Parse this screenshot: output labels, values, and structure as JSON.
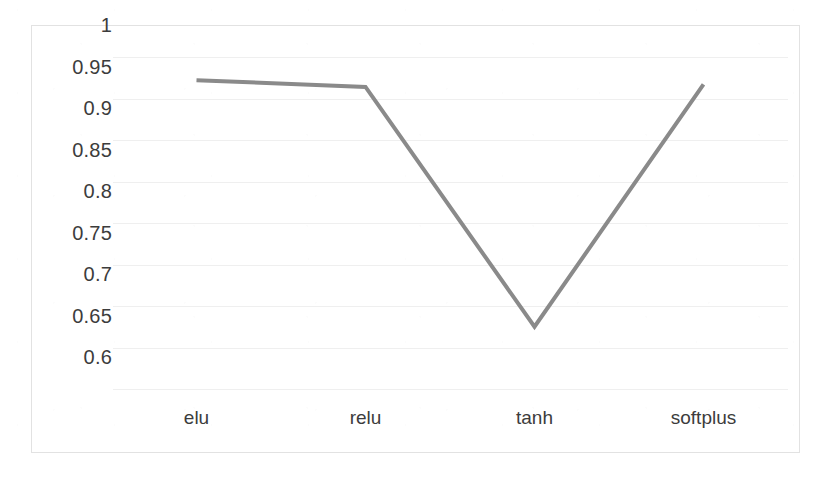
{
  "chart_data": {
    "type": "line",
    "title": "",
    "subtitle": "",
    "xlabel": "",
    "ylabel": "",
    "categories": [
      "elu",
      "relu",
      "tanh",
      "softplus"
    ],
    "values": [
      0.972,
      0.964,
      0.675,
      0.967
    ],
    "series": [
      {
        "name": "accuracy",
        "values": [
          0.972,
          0.964,
          0.675,
          0.967
        ],
        "color": "#8a8a8a"
      }
    ],
    "ylim": [
      0.6,
      1.0
    ],
    "ytick_step": 0.05,
    "yticks": [
      1,
      0.95,
      0.9,
      0.85,
      0.8,
      0.75,
      0.7,
      0.65,
      0.6
    ],
    "ytick_labels": [
      "1",
      "0.95",
      "0.9",
      "0.85",
      "0.8",
      "0.75",
      "0.7",
      "0.65",
      "0.6"
    ],
    "xticks": [
      "elu",
      "relu",
      "tanh",
      "softplus"
    ],
    "grid": true,
    "grid_axis": "y",
    "legend": false,
    "legend_position": "none",
    "annotations": [],
    "markers": false,
    "line_width": 4
  },
  "axes": {
    "y_labels": [
      "1",
      "0.95",
      "0.9",
      "0.85",
      "0.8",
      "0.75",
      "0.7",
      "0.65",
      "0.6"
    ],
    "x_labels": [
      "elu",
      "relu",
      "tanh",
      "softplus"
    ]
  },
  "style": {
    "line_color": "#8a8a8a",
    "gridline_color": "#efefef",
    "frame_color": "#e2e2e2",
    "text_color": "#3c3c3c",
    "background": "#ffffff"
  }
}
